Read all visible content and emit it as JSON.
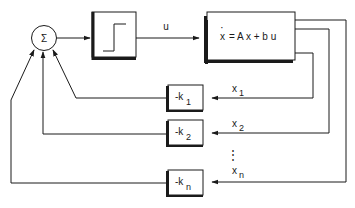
{
  "diagram": {
    "type": "block-diagram",
    "title": "",
    "summing_junction": {
      "symbol": "Σ"
    },
    "relay_block": {
      "icon": "step-function-icon"
    },
    "signal_u": "u",
    "plant": {
      "equation_lhs": "x",
      "equation_rhs": "= A x + b u",
      "dot": "·"
    },
    "gains": [
      {
        "label": "-k",
        "sub": "1"
      },
      {
        "label": "-k",
        "sub": "2"
      },
      {
        "label": "-k",
        "sub": "n"
      }
    ],
    "states": [
      {
        "label": "x",
        "sub": "1"
      },
      {
        "label": "x",
        "sub": "2"
      },
      {
        "label": "x",
        "sub": "n"
      }
    ],
    "ellipsis": "⋮",
    "colors": {
      "line": "#1a1a1a",
      "background": "#ffffff"
    }
  }
}
